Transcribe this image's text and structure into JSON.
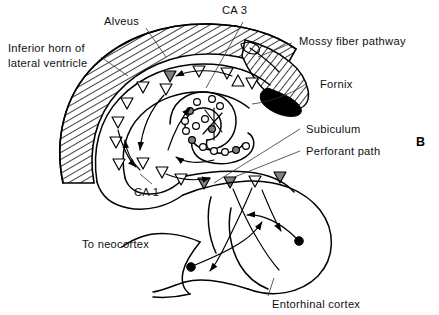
{
  "figure": {
    "panel_label": "B",
    "background_color": "#ffffff",
    "ink_color": "#000000",
    "fill_gray": "#808080"
  },
  "labels": {
    "inferior_horn": "Inferior horn of\nlateral ventricle",
    "inferior_horn_line1": "Inferior horn of",
    "inferior_horn_line2": "lateral ventricle",
    "alveus": "Alveus",
    "ca3": "CA 3",
    "ca1": "CA 1",
    "mossy_fiber": "Mossy fiber pathway",
    "fornix": "Fornix",
    "subiculum": "Subiculum",
    "perforant_path": "Perforant path",
    "to_neocortex": "To neocortex",
    "entorhinal_cortex": "Entorhinal cortex"
  },
  "structures": [
    {
      "name": "inferior-horn-of-lateral-ventricle",
      "label": "Inferior horn of lateral ventricle",
      "rendering": "diagonal-hatched crescent",
      "hatch_angle_deg": 60
    },
    {
      "name": "alveus",
      "label": "Alveus",
      "rendering": "thin band at outer edge of hatched crescent"
    },
    {
      "name": "ca3-pyramidal-layer",
      "label": "CA 3",
      "rendering": "band of triangles, superior/medial limb"
    },
    {
      "name": "ca1-pyramidal-layer",
      "label": "CA 1",
      "rendering": "band of triangles, inferior/lateral limb"
    },
    {
      "name": "dentate-gyrus-granule-layer",
      "label": "Dentate gyrus granule cells",
      "rendering": "C-shaped chain of small circles"
    },
    {
      "name": "mossy-fiber-pathway",
      "label": "Mossy fiber pathway",
      "rendering": "hatched tongue running to fornix"
    },
    {
      "name": "fornix",
      "label": "Fornix",
      "rendering": "solid black wedge"
    },
    {
      "name": "subiculum",
      "label": "Subiculum",
      "rendering": "transition cortex inferior to CA1"
    },
    {
      "name": "perforant-path",
      "label": "Perforant path",
      "rendering": "arrowed fibers from entorhinal cortex"
    },
    {
      "name": "entorhinal-cortex",
      "label": "Entorhinal cortex",
      "rendering": "rounded lobe with two filled somata"
    },
    {
      "name": "to-neocortex",
      "label": "To neocortex",
      "rendering": "efferent curve exiting left"
    }
  ],
  "cell_markers": {
    "pyramidal_triangles": {
      "open_count": 14,
      "filled_count": 4,
      "filled_color": "#808080",
      "open_color": "#ffffff"
    },
    "granule_circles": {
      "open_count": 11,
      "filled_count": 4,
      "filled_color": "#808080",
      "open_color": "#ffffff"
    },
    "entorhinal_somata": {
      "count": 2,
      "color": "#000000"
    }
  }
}
